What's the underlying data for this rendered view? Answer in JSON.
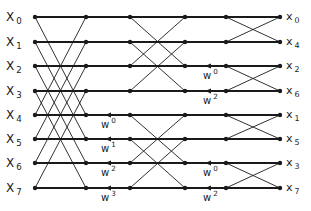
{
  "diagram": {
    "columns_x": [
      35,
      86,
      130,
      185,
      226,
      280
    ],
    "rows_y": [
      17,
      42,
      66,
      91,
      115,
      139,
      163,
      188
    ],
    "inputs": [
      {
        "base": "X",
        "sub": "0"
      },
      {
        "base": "X",
        "sub": "1"
      },
      {
        "base": "X",
        "sub": "2"
      },
      {
        "base": "X",
        "sub": "3"
      },
      {
        "base": "X",
        "sub": "4"
      },
      {
        "base": "X",
        "sub": "5"
      },
      {
        "base": "X",
        "sub": "6"
      },
      {
        "base": "X",
        "sub": "7"
      }
    ],
    "outputs": [
      {
        "base": "x",
        "sub": "0"
      },
      {
        "base": "x",
        "sub": "4"
      },
      {
        "base": "x",
        "sub": "2"
      },
      {
        "base": "x",
        "sub": "6"
      },
      {
        "base": "x",
        "sub": "1"
      },
      {
        "base": "x",
        "sub": "5"
      },
      {
        "base": "x",
        "sub": "3"
      },
      {
        "base": "x",
        "sub": "7"
      }
    ],
    "stage1_twiddles": [
      {
        "row": 4,
        "base": "w",
        "exp": "0"
      },
      {
        "row": 5,
        "base": "w",
        "exp": "1"
      },
      {
        "row": 6,
        "base": "w",
        "exp": "2"
      },
      {
        "row": 7,
        "base": "w",
        "exp": "3"
      }
    ],
    "stage2_twiddles": [
      {
        "row": 2,
        "base": "w",
        "exp": "0"
      },
      {
        "row": 3,
        "base": "w",
        "exp": "2"
      },
      {
        "row": 6,
        "base": "w",
        "exp": "0"
      },
      {
        "row": 7,
        "base": "w",
        "exp": "2"
      }
    ],
    "line_color": "#1a1a1a"
  }
}
